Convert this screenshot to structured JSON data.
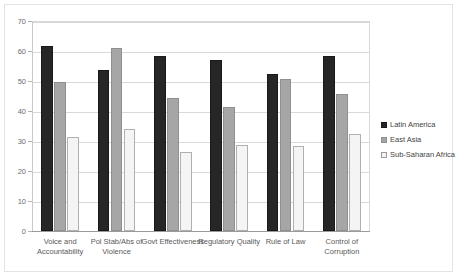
{
  "chart_data": {
    "type": "bar",
    "title": "",
    "subtitle": "",
    "xlabel": "",
    "ylabel": "",
    "ylim": [
      0,
      70
    ],
    "yticks": [
      0,
      10,
      20,
      30,
      40,
      50,
      60,
      70
    ],
    "grid": true,
    "legend_position": "right",
    "categories": [
      "Voice and\nAccountability",
      "Pol Stab/Abs of\nViolence",
      "Govt Effectiveness",
      "Regulatory Quality",
      "Rule of Law",
      "Control of\nCorruption"
    ],
    "series": [
      {
        "name": "Latin America",
        "color": "#262626",
        "values": [
          61.7,
          53.7,
          58.4,
          57.0,
          52.5,
          58.5
        ]
      },
      {
        "name": "East Asia",
        "color": "#a6a6a6",
        "values": [
          49.6,
          60.9,
          44.4,
          41.2,
          50.6,
          45.6
        ]
      },
      {
        "name": "Sub-Saharan Africa",
        "color": "#f4f4f4",
        "values": [
          31.4,
          34.1,
          26.5,
          28.7,
          28.2,
          32.2
        ]
      }
    ]
  },
  "legend": {
    "items": [
      {
        "label": "Latin America"
      },
      {
        "label": "East Asia"
      },
      {
        "label": "Sub-Saharan Africa"
      }
    ]
  }
}
